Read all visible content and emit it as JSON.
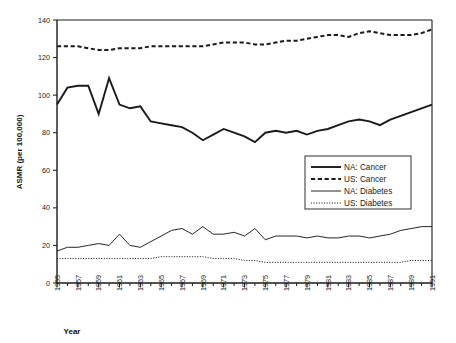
{
  "chart_data": {
    "type": "line",
    "title": "",
    "xlabel": "Year",
    "ylabel": "ASMR (per 100,000)",
    "xlim": [
      1955,
      1991
    ],
    "ylim": [
      0,
      140
    ],
    "ytick_step": 20,
    "yticks": [
      0,
      20,
      40,
      60,
      80,
      100,
      120,
      140
    ],
    "xticks": [
      1955,
      1957,
      1959,
      1961,
      1963,
      1965,
      1967,
      1969,
      1971,
      1973,
      1975,
      1977,
      1979,
      1981,
      1983,
      1985,
      1987,
      1989,
      1991
    ],
    "xtick_labels": [
      "1955",
      "1957",
      "1959",
      "1961",
      "1963",
      "1965",
      "1967",
      "1969",
      "1971",
      "1973",
      "1975",
      "1977",
      "1979",
      "1981",
      "1983",
      "1985",
      "1987",
      "1989",
      "1991"
    ],
    "minor_xticks_every": 1,
    "grid": false,
    "legend_position": "center-right-inside",
    "x": [
      1955,
      1956,
      1957,
      1958,
      1959,
      1960,
      1961,
      1962,
      1963,
      1964,
      1965,
      1966,
      1967,
      1968,
      1969,
      1970,
      1971,
      1972,
      1973,
      1974,
      1975,
      1976,
      1977,
      1978,
      1979,
      1980,
      1981,
      1982,
      1983,
      1984,
      1985,
      1986,
      1987,
      1988,
      1989,
      1990,
      1991
    ],
    "series": [
      {
        "name": "NA: Cancer",
        "style": "solid-thick",
        "values": [
          95,
          104,
          105,
          105,
          90,
          109,
          95,
          93,
          94,
          86,
          85,
          84,
          83,
          80,
          76,
          79,
          82,
          80,
          78,
          75,
          80,
          81,
          80,
          81,
          79,
          81,
          82,
          84,
          86,
          87,
          86,
          84,
          87,
          89,
          91,
          93,
          95
        ]
      },
      {
        "name": "US: Cancer",
        "style": "dashed-thick",
        "values": [
          126,
          126,
          126,
          125,
          124,
          124,
          125,
          125,
          125,
          126,
          126,
          126,
          126,
          126,
          126,
          127,
          128,
          128,
          128,
          127,
          127,
          128,
          129,
          129,
          130,
          131,
          132,
          132,
          131,
          133,
          134,
          133,
          132,
          132,
          132,
          133,
          135
        ]
      },
      {
        "name": "NA: Diabetes",
        "style": "solid-thin",
        "values": [
          17,
          19,
          19,
          20,
          21,
          20,
          26,
          20,
          19,
          22,
          25,
          28,
          29,
          26,
          30,
          26,
          26,
          27,
          25,
          29,
          23,
          25,
          25,
          25,
          24,
          25,
          24,
          24,
          25,
          25,
          24,
          25,
          26,
          28,
          29,
          30,
          30
        ]
      },
      {
        "name": "US: Diabetes",
        "style": "dotted-thin",
        "values": [
          13,
          13,
          13,
          13,
          13,
          13,
          13,
          13,
          13,
          13,
          14,
          14,
          14,
          14,
          14,
          13,
          13,
          13,
          12,
          12,
          11,
          11,
          11,
          11,
          11,
          11,
          11,
          11,
          11,
          11,
          11,
          11,
          11,
          11,
          12,
          12,
          12
        ]
      }
    ]
  },
  "legend": {
    "items": [
      {
        "label": "NA: Cancer",
        "style": "solid-thick"
      },
      {
        "label": "US: Cancer",
        "style": "dashed-thick"
      },
      {
        "label": "NA: Diabetes",
        "style": "solid-thin"
      },
      {
        "label": "US: Diabetes",
        "style": "dotted-thin"
      }
    ]
  },
  "colors": {
    "line": "#1a1a1a",
    "axis": "#1a1a1a",
    "background": "#ffffff",
    "plot_border": "#1a1a1a"
  }
}
